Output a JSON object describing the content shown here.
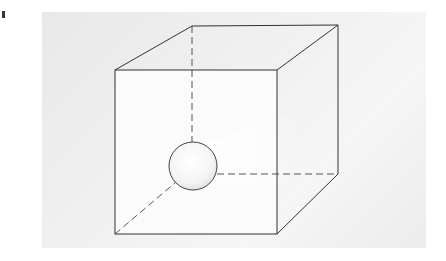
{
  "figure": {
    "colors": {
      "edge": "#333333",
      "hidden_edge": "#555555",
      "background_panel": "#efefef",
      "sphere_fill": "#fafafa"
    },
    "cube": {
      "front": {
        "tl": [
          115,
          70
        ],
        "tr": [
          277,
          70
        ],
        "br": [
          277,
          234
        ],
        "bl": [
          115,
          234
        ]
      },
      "back": {
        "tl": [
          192,
          26
        ],
        "tr": [
          338,
          25
        ],
        "br": [
          338,
          174
        ],
        "bl": [
          192,
          174
        ]
      }
    },
    "sphere": {
      "cx": 193,
      "cy": 166,
      "r": 24
    }
  }
}
